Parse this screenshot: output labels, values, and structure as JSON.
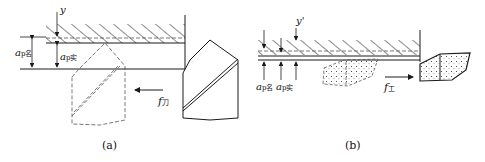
{
  "figure": {
    "panel_a": {
      "caption": "(a)",
      "labels": {
        "deflection": "y",
        "ap_nominal_main": "a",
        "ap_nominal_sub": "p名",
        "ap_actual_main": "a",
        "ap_actual_sub": "p实",
        "feed_main": "f",
        "feed_sub": "刀"
      }
    },
    "panel_b": {
      "caption": "(b)",
      "labels": {
        "deflection": "y'",
        "ap_nominal_main": "a",
        "ap_nominal_sub": "p名",
        "ap_actual_main": "a",
        "ap_actual_sub": "p实",
        "feed_main": "f",
        "feed_sub": "工"
      }
    }
  },
  "colors": {
    "ink": "#1a1a1a",
    "dash": "#555555",
    "background": "#ffffff"
  }
}
